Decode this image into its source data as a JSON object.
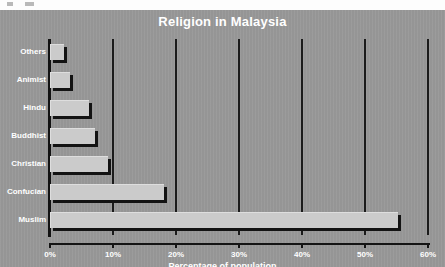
{
  "chart_data": {
    "type": "bar",
    "orientation": "horizontal",
    "title": "Religion in Malaysia",
    "xlabel": "Percentage of population",
    "ylabel": "",
    "xlim": [
      0,
      60
    ],
    "xticks": [
      0,
      10,
      20,
      30,
      40,
      50,
      60
    ],
    "xtick_labels": [
      "0%",
      "10%",
      "20%",
      "30%",
      "40%",
      "50%",
      "60%"
    ],
    "grid": true,
    "legend": null,
    "categories": [
      "Others",
      "Animist",
      "Hindu",
      "Buddhist",
      "Christian",
      "Confucian",
      "Muslim"
    ],
    "values": [
      2,
      3,
      6,
      7,
      9,
      18,
      55
    ],
    "bars": [
      {
        "label": "Others",
        "value": 2
      },
      {
        "label": "Animist",
        "value": 3
      },
      {
        "label": "Hindu",
        "value": 6
      },
      {
        "label": "Buddhist",
        "value": 7
      },
      {
        "label": "Christian",
        "value": 9
      },
      {
        "label": "Confucian",
        "value": 18
      },
      {
        "label": "Muslim",
        "value": 55
      }
    ],
    "colors": {
      "background": "#989898",
      "bar_fill": "#cbcbcb",
      "bar_shadow": "#131313",
      "axis": "#141414",
      "gridline": "#1b1b1b",
      "text": "#ffffff"
    }
  }
}
